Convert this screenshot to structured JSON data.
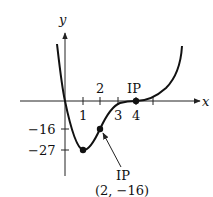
{
  "figure": {
    "function": "f(x) = x(x - 4)^3",
    "axes": {
      "x_label": "x",
      "y_label": "y"
    },
    "x_ticks": [
      {
        "value": 1,
        "label": "1"
      },
      {
        "value": 2,
        "label": "2"
      },
      {
        "value": 3,
        "label": "3"
      },
      {
        "value": 4,
        "label": "4"
      },
      {
        "value": 5,
        "label": ""
      }
    ],
    "y_ticks": [
      {
        "value": -16,
        "label": "−16"
      },
      {
        "value": -27,
        "label": "−27"
      }
    ],
    "points": [
      {
        "name": "minimum",
        "x": 1,
        "y": -27
      },
      {
        "name": "inflection-1",
        "x": 2,
        "y": -16,
        "label": "IP",
        "coord_label": "(2, −16)"
      },
      {
        "name": "inflection-2",
        "x": 4,
        "y": 0,
        "label": "IP"
      }
    ],
    "colors": {
      "curve": "#111111",
      "axis": "#222222",
      "point": "#111111"
    }
  }
}
